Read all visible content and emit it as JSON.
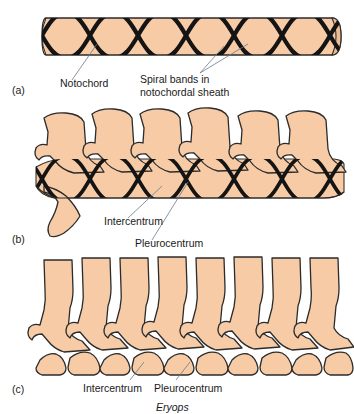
{
  "figure": {
    "type": "anatomical-diagram",
    "subject": "Eryops",
    "caption": "Eryops",
    "background_color": "#ffffff",
    "bone_fill_color": "#F6CBA6",
    "bone_outline_color": "#2b2b2b",
    "band_color": "#141414",
    "leader_color": "#6b7a86"
  },
  "panels": [
    {
      "letter": "(a)",
      "description": "notochord cylinder with spiral bands",
      "labels": [
        {
          "id": "notochord",
          "text": "Notochord"
        },
        {
          "id": "spiral-bands-line1",
          "text": "Spiral bands in"
        },
        {
          "id": "spiral-bands-line2",
          "text": "notochordal sheath"
        }
      ]
    },
    {
      "letter": "(b)",
      "description": "neural arches above banded notochord",
      "labels": [
        {
          "id": "intercentrum",
          "text": "Intercentrum"
        },
        {
          "id": "pleurocentrum",
          "text": "Pleurocentrum"
        }
      ]
    },
    {
      "letter": "(c)",
      "description": "Eryops vertebrae with separate intercentra and pleurocentra",
      "labels": [
        {
          "id": "intercentrum",
          "text": "Intercentrum"
        },
        {
          "id": "pleurocentrum",
          "text": "Pleurocentrum"
        }
      ]
    }
  ],
  "text": {
    "panel_a_letter": "(a)",
    "panel_b_letter": "(b)",
    "panel_c_letter": "(c)",
    "notochord": "Notochord",
    "spiral_bands_l1": "Spiral bands in",
    "spiral_bands_l2": "notochordal sheath",
    "intercentrum_b": "Intercentrum",
    "pleurocentrum_b": "Pleurocentrum",
    "intercentrum_c": "Intercentrum",
    "pleurocentrum_c": "Pleurocentrum",
    "genus_caption": "Eryops"
  }
}
